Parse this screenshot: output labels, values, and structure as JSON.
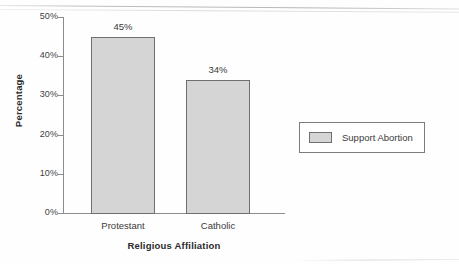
{
  "chart_data": {
    "type": "bar",
    "title": "",
    "xlabel": "Religious Affiliation",
    "ylabel": "Percentage",
    "categories": [
      "Protestant",
      "Catholic"
    ],
    "values": [
      45,
      34
    ],
    "value_labels": [
      "45%",
      "34%"
    ],
    "series": [
      {
        "name": "Support Abortion",
        "values": [
          45,
          34
        ],
        "color": "#d5d5d5"
      }
    ],
    "ylim": [
      0,
      50
    ],
    "ytick_values": [
      0,
      10,
      20,
      30,
      40,
      50
    ],
    "ytick_labels": [
      "0%",
      "10%",
      "20%",
      "30%",
      "40%",
      "50%"
    ],
    "grid": false,
    "legend_position": "right"
  },
  "legend": {
    "entries": [
      {
        "label": "Support Abortion",
        "swatch_color": "#d5d5d5"
      }
    ]
  },
  "axes": {
    "y_title": "Percentage",
    "x_title": "Religious Affiliation"
  },
  "colors": {
    "bar_fill": "#d5d5d5",
    "bar_stroke": "#6f6f6f",
    "axis": "#8c8c8c",
    "text": "#3a3a3a",
    "background": "#fefefe"
  }
}
